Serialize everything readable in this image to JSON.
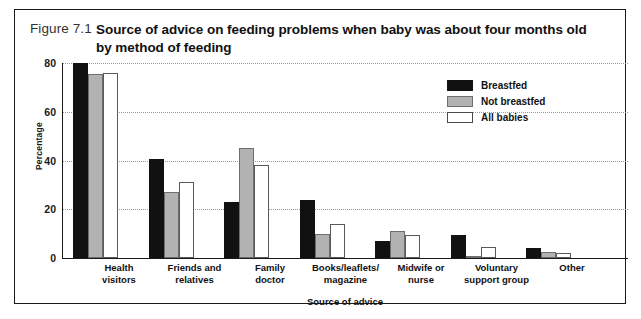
{
  "figure": {
    "number": "Figure 7.1",
    "title": "Source of advice on feeding problems when baby was about four months old by method of feeding"
  },
  "chart_data": {
    "type": "bar",
    "title": "Source of advice on feeding problems when baby was about four months old by method of feeding",
    "xlabel": "Source of advice",
    "ylabel": "Percentage",
    "ylim": [
      0,
      80
    ],
    "yticks": [
      0,
      20,
      40,
      60,
      80
    ],
    "grid": true,
    "legend_position": "top-right",
    "categories": [
      "Health visitors",
      "Friends and relatives",
      "Family doctor",
      "Books/leaflets/ magazine",
      "Midwife or nurse",
      "Voluntary support group",
      "Other"
    ],
    "category_lines": [
      [
        "Health",
        "visitors"
      ],
      [
        "Friends and",
        "relatives"
      ],
      [
        "Family",
        "doctor"
      ],
      [
        "Books/leaflets/",
        "magazine"
      ],
      [
        "Midwife or",
        "nurse"
      ],
      [
        "Voluntary",
        "support group"
      ],
      [
        "Other",
        ""
      ]
    ],
    "series": [
      {
        "name": "Breastfed",
        "color": "#111111",
        "values": [
          80,
          40.5,
          23,
          24,
          7,
          9.5,
          4
        ]
      },
      {
        "name": "Not breastfed",
        "color": "#b2b2b2",
        "values": [
          75.5,
          27,
          45,
          10,
          11,
          1,
          2.5
        ]
      },
      {
        "name": "All babies",
        "color": "#ffffff",
        "values": [
          76,
          31,
          38,
          14,
          9.5,
          4.5,
          2
        ]
      }
    ]
  }
}
